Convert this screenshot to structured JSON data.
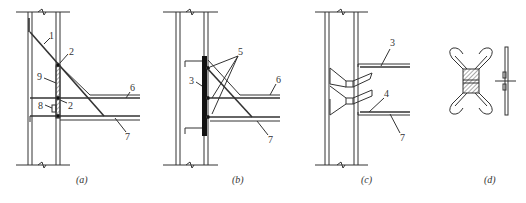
{
  "figure": {
    "panels": [
      {
        "id": "a",
        "caption": "(a)",
        "labels": {
          "l1": "1",
          "l2a": "2",
          "l2b": "2",
          "l6": "6",
          "l7": "7",
          "l8": "8",
          "l9": "9"
        }
      },
      {
        "id": "b",
        "caption": "(b)",
        "labels": {
          "l3": "3",
          "l5": "5",
          "l6": "6",
          "l7": "7"
        }
      },
      {
        "id": "c",
        "caption": "(c)",
        "labels": {
          "l3": "3",
          "l4": "4",
          "l7": "7"
        }
      },
      {
        "id": "d",
        "caption": "(d)"
      }
    ],
    "colors": {
      "line": "#333333",
      "fill": "#111111",
      "hatch": "#555555"
    }
  }
}
